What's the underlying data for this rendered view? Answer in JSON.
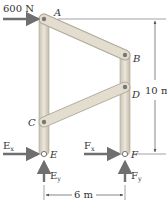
{
  "diagram": {
    "applied_load": {
      "label": "600 N",
      "at": "A",
      "direction": "right"
    },
    "joints": [
      "A",
      "B",
      "C",
      "D",
      "E",
      "F"
    ],
    "reactions": {
      "Ex": {
        "main": "E",
        "sub": "x"
      },
      "Ey": {
        "main": "E",
        "sub": "y"
      },
      "Fx": {
        "main": "F",
        "sub": "x"
      },
      "Fy": {
        "main": "F",
        "sub": "y"
      }
    },
    "dimensions": {
      "height": "10 m",
      "width": "6 m"
    },
    "colors": {
      "member": "#d8d2c4",
      "member_edge": "#b0a898",
      "arrow": "#6f6f6f",
      "text": "#333333"
    }
  }
}
